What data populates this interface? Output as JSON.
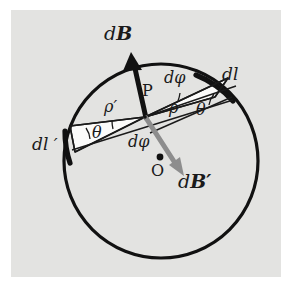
{
  "figure": {
    "domain": "physics-diagram",
    "background_color": "#e3e3e1",
    "page_color": "#ffffff",
    "ink_color": "#1a1a1a",
    "accent_gray": "#8a8a8a",
    "panel": {
      "x": 11,
      "y": 10,
      "width": 270,
      "height": 267
    },
    "circle": {
      "cx": 161,
      "cy": 161,
      "r": 97,
      "stroke_width": 3.2
    },
    "point_P": {
      "x": 145,
      "y": 117
    },
    "point_O": {
      "x": 160,
      "y": 157
    }
  },
  "labels": {
    "dB": {
      "text": "dB",
      "prefix": "d",
      "vector": "B",
      "x": 104,
      "y": 24
    },
    "dB_prime": {
      "text": "dB′",
      "prefix": "d",
      "vector": "B′",
      "x": 178,
      "y": 172
    },
    "dl": {
      "text": "dl",
      "x": 222,
      "y": 66
    },
    "dl_prime": {
      "text": "dl ′",
      "x": 32,
      "y": 136
    },
    "d_phi_upper": {
      "text": "dφ",
      "x": 164,
      "y": 70
    },
    "d_phi_lower": {
      "text": "dφ",
      "x": 128,
      "y": 134
    },
    "rho": {
      "text": "ρ",
      "x": 169,
      "y": 100
    },
    "rho_prime": {
      "text": "ρ′",
      "x": 104,
      "y": 99
    },
    "theta_right": {
      "text": "θ",
      "x": 196,
      "y": 102
    },
    "theta_left": {
      "text": "θ",
      "x": 92,
      "y": 125
    },
    "P": {
      "text": "P",
      "x": 142,
      "y": 83
    },
    "O": {
      "text": "O",
      "x": 151,
      "y": 163
    }
  },
  "elements": {
    "circle_loop": "current-carrying circular loop",
    "arrow_dB": "bold black arrow from P pointing up-left",
    "arrow_dB_prime": "gray arrow from P pointing down-right through O",
    "wedge_right": "white triangular wedge subtending dl at P",
    "wedge_left": "white triangular wedge subtending dl' at P",
    "arc_dl": "thick arc element dl on upper-right of circle",
    "arc_dl_prime": "thick arc element dl' on left of circle"
  }
}
